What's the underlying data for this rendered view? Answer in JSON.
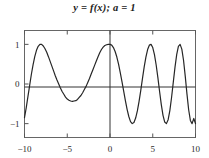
{
  "chart_data": {
    "type": "line",
    "title": "y = f(x); a = 1",
    "xlabel": "",
    "ylabel": "",
    "xlim": [
      -10,
      10
    ],
    "ylim": [
      -1.35,
      1.35
    ],
    "xticks": [
      -10,
      -5,
      0,
      5,
      10
    ],
    "xticklabels": [
      "-10",
      "-5",
      "0",
      "5",
      "10"
    ],
    "yticks": [
      -1,
      0,
      1
    ],
    "yticklabels": [
      "-1",
      "0",
      "1"
    ],
    "grid": false,
    "legend": false,
    "frame": true,
    "axis_lines": {
      "x_axis_at_y": 0,
      "y_axis_at_x": 0
    },
    "line_color": "#262626",
    "line_width": 1.2,
    "series": [
      {
        "name": "f(x)",
        "description": "chirp: cosine with frequency increasing with |x| on the right side",
        "x": [
          -10.0,
          -9.8,
          -9.6,
          -9.4,
          -9.2,
          -9.0,
          -8.8,
          -8.6,
          -8.4,
          -8.2,
          -8.0,
          -7.8,
          -7.6,
          -7.4,
          -7.2,
          -7.0,
          -6.8,
          -6.6,
          -6.4,
          -6.2,
          -6.0,
          -5.8,
          -5.6,
          -5.4,
          -5.2,
          -5.0,
          -4.8,
          -4.6,
          -4.4,
          -4.2,
          -4.0,
          -3.8,
          -3.6,
          -3.4,
          -3.2,
          -3.0,
          -2.8,
          -2.6,
          -2.4,
          -2.2,
          -2.0,
          -1.8,
          -1.6,
          -1.4,
          -1.2,
          -1.0,
          -0.8,
          -0.6,
          -0.4,
          -0.2,
          0.0,
          0.2,
          0.4,
          0.6,
          0.8,
          1.0,
          1.2,
          1.4,
          1.6,
          1.8,
          2.0,
          2.2,
          2.4,
          2.6,
          2.8,
          3.0,
          3.2,
          3.4,
          3.6,
          3.8,
          4.0,
          4.2,
          4.4,
          4.6,
          4.8,
          5.0,
          5.2,
          5.4,
          5.6,
          5.8,
          6.0,
          6.2,
          6.4,
          6.6,
          6.8,
          7.0,
          7.2,
          7.4,
          7.6,
          7.8,
          8.0,
          8.2,
          8.4,
          8.6,
          8.8,
          9.0,
          9.2,
          9.4,
          9.6,
          9.8,
          10.0
        ],
        "y": [
          -0.85,
          -0.6,
          -0.32,
          -0.04,
          0.24,
          0.48,
          0.69,
          0.85,
          0.95,
          1.0,
          1.0,
          0.96,
          0.89,
          0.8,
          0.69,
          0.57,
          0.45,
          0.33,
          0.21,
          0.1,
          0.0,
          -0.1,
          -0.19,
          -0.26,
          -0.33,
          -0.38,
          -0.41,
          -0.43,
          -0.44,
          -0.43,
          -0.42,
          -0.39,
          -0.34,
          -0.29,
          -0.22,
          -0.14,
          -0.06,
          0.04,
          0.14,
          0.25,
          0.36,
          0.47,
          0.58,
          0.69,
          0.79,
          0.87,
          0.93,
          0.97,
          0.99,
          1.0,
          1.0,
          0.98,
          0.92,
          0.82,
          0.68,
          0.5,
          0.29,
          0.06,
          -0.18,
          -0.42,
          -0.64,
          -0.82,
          -0.95,
          -1.0,
          -0.97,
          -0.86,
          -0.68,
          -0.44,
          -0.16,
          0.14,
          0.43,
          0.68,
          0.87,
          0.98,
          1.0,
          0.92,
          0.74,
          0.48,
          0.16,
          -0.19,
          -0.52,
          -0.79,
          -0.96,
          -1.0,
          -0.9,
          -0.67,
          -0.34,
          0.04,
          0.42,
          0.74,
          0.95,
          1.0,
          0.88,
          0.6,
          0.2,
          -0.25,
          -0.65,
          -0.92,
          -1.0,
          -0.87,
          -1.0
        ]
      }
    ]
  },
  "figure": {
    "background_color": "#ffffff",
    "frame_color": "#555555",
    "axis_color": "#333333",
    "tick_color": "#555555",
    "title_color": "#1a1a1a"
  }
}
